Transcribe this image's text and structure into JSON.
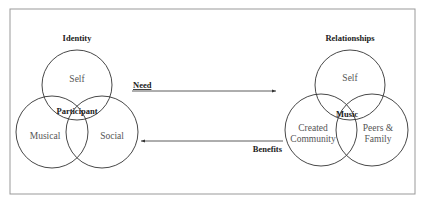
{
  "diagram": {
    "left_group": {
      "title": "Identity",
      "center_label": "Participant",
      "circles": [
        {
          "label": "Self"
        },
        {
          "label": "Musical"
        },
        {
          "label": "Social"
        }
      ]
    },
    "right_group": {
      "title": "Relationships",
      "center_label": "Music",
      "circles": [
        {
          "label": "Self"
        },
        {
          "label_line1": "Created",
          "label_line2": "Community"
        },
        {
          "label_line1": "Peers &",
          "label_line2": "Family"
        }
      ]
    },
    "arrows": {
      "need": {
        "label": "Need",
        "direction": "right"
      },
      "benefits": {
        "label": "Benefits",
        "direction": "left"
      }
    },
    "colors": {
      "stroke": "#333333",
      "frame": "#999999",
      "text": "#555555"
    }
  }
}
